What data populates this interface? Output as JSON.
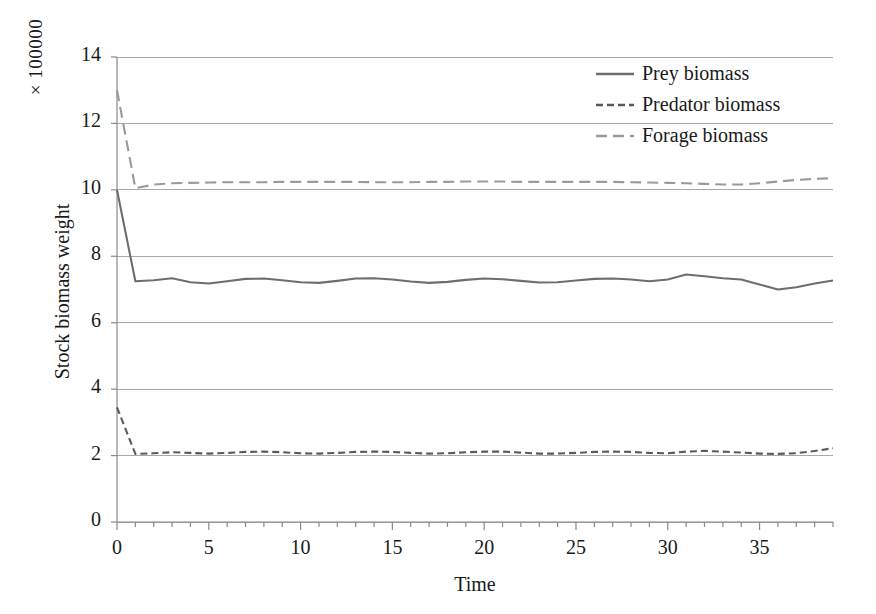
{
  "chart_data": {
    "type": "line",
    "title": "",
    "xlabel": "Time",
    "ylabel": "Stock biomass weight",
    "y_multiplier": "× 100000",
    "xlim": [
      0,
      39
    ],
    "ylim": [
      0,
      14
    ],
    "xticks": [
      0,
      5,
      10,
      15,
      20,
      25,
      30,
      35
    ],
    "xticklabels": [
      "0",
      "5",
      "10",
      "15",
      "20",
      "25",
      "30",
      "35"
    ],
    "yticks": [
      0,
      2,
      4,
      6,
      8,
      10,
      12,
      14
    ],
    "yticklabels": [
      "0",
      "2",
      "4",
      "6",
      "8",
      "10",
      "12",
      "14"
    ],
    "minor_xtick_interval": 1,
    "grid": "horizontal",
    "legend_position": "top-right",
    "x": [
      0,
      1,
      2,
      3,
      4,
      5,
      6,
      7,
      8,
      9,
      10,
      11,
      12,
      13,
      14,
      15,
      16,
      17,
      18,
      19,
      20,
      21,
      22,
      23,
      24,
      25,
      26,
      27,
      28,
      29,
      30,
      31,
      32,
      33,
      34,
      35,
      36,
      37,
      38,
      39
    ],
    "series": [
      {
        "name": "Prey biomass",
        "style": "solid",
        "color": "#6e6e6e",
        "values": [
          10.0,
          7.25,
          7.28,
          7.34,
          7.22,
          7.18,
          7.25,
          7.32,
          7.33,
          7.28,
          7.22,
          7.2,
          7.26,
          7.33,
          7.34,
          7.3,
          7.24,
          7.2,
          7.23,
          7.29,
          7.33,
          7.31,
          7.26,
          7.21,
          7.22,
          7.27,
          7.32,
          7.33,
          7.3,
          7.25,
          7.3,
          7.45,
          7.4,
          7.34,
          7.3,
          7.15,
          7.0,
          7.07,
          7.18,
          7.27
        ]
      },
      {
        "name": "Predator biomass",
        "style": "dashed-short",
        "color": "#5a5a5a",
        "values": [
          3.45,
          2.05,
          2.07,
          2.1,
          2.08,
          2.06,
          2.08,
          2.11,
          2.12,
          2.1,
          2.07,
          2.06,
          2.08,
          2.11,
          2.12,
          2.11,
          2.08,
          2.06,
          2.07,
          2.1,
          2.12,
          2.12,
          2.09,
          2.06,
          2.06,
          2.08,
          2.11,
          2.12,
          2.11,
          2.08,
          2.07,
          2.12,
          2.14,
          2.12,
          2.09,
          2.06,
          2.05,
          2.07,
          2.14,
          2.22
        ]
      },
      {
        "name": "Forage biomass",
        "style": "dashed-long",
        "color": "#9a9a9a",
        "values": [
          13.0,
          10.05,
          10.16,
          10.2,
          10.21,
          10.22,
          10.23,
          10.23,
          10.23,
          10.24,
          10.24,
          10.24,
          10.24,
          10.24,
          10.23,
          10.23,
          10.23,
          10.24,
          10.24,
          10.25,
          10.25,
          10.25,
          10.24,
          10.24,
          10.24,
          10.24,
          10.24,
          10.24,
          10.23,
          10.22,
          10.21,
          10.2,
          10.18,
          10.16,
          10.16,
          10.2,
          10.25,
          10.3,
          10.33,
          10.35
        ]
      }
    ]
  },
  "axes_geometry": {
    "plot_left": 117,
    "plot_right": 833,
    "plot_top": 57,
    "plot_bottom": 522
  },
  "colors": {
    "axis": "#8a8a8a",
    "grid": "#a8a8a8",
    "text": "#1a1a1a",
    "prey": "#6e6e6e",
    "predator": "#5a5a5a",
    "forage": "#9a9a9a",
    "background": "#ffffff"
  }
}
